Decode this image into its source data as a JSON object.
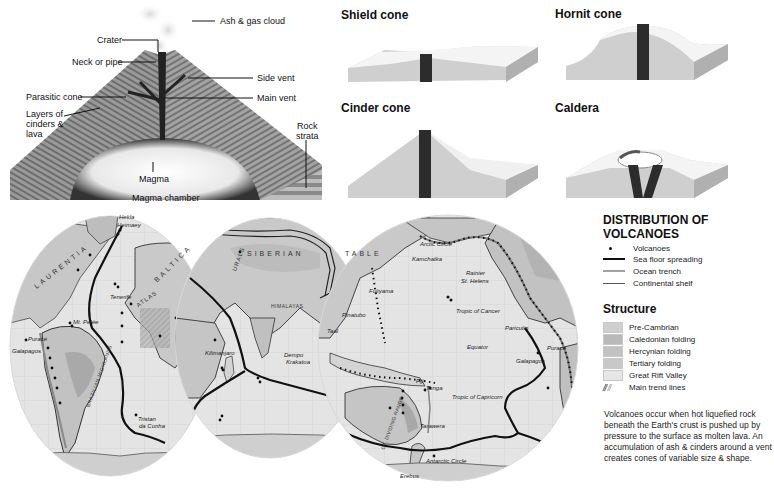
{
  "volcano_diagram": {
    "labels": {
      "ash_cloud": "Ash & gas cloud",
      "crater": "Crater",
      "neck": "Neck or pipe",
      "side_vent": "Side vent",
      "parasitic_cone": "Parasitic cone",
      "main_vent": "Main vent",
      "layers": [
        "Layers of",
        "cinders &",
        "lava"
      ],
      "rock_strata": [
        "Rock",
        "strata"
      ],
      "magma": "Magma",
      "magma_chamber": "Magma chamber"
    }
  },
  "cone_types": [
    {
      "title": "Shield cone"
    },
    {
      "title": "Hornit cone"
    },
    {
      "title": "Cinder cone"
    },
    {
      "title": "Caldera"
    }
  ],
  "map": {
    "regions": [
      "LAURENTIA",
      "BALTICA",
      "ATLAS",
      "SIBERIAN",
      "TABLE",
      "URALS",
      "BRAZILIAN HIGHLANDS",
      "HIMALAYAS",
      "GT. DIVIDING RANGE"
    ],
    "places": {
      "hekla": "Hekla",
      "heimaey": "Heimaey",
      "tenerife": "Tenerife",
      "mt_pelee": "Mt. Pelée",
      "purace_w": "Puracé",
      "galapagos_w": "Galapagos",
      "tristan": [
        "Tristan",
        "da Cunha"
      ],
      "kilimanjaro": "Kilimanjaro",
      "dempo": "Dempo",
      "krakatoa": "Krakatoa",
      "pinatubo": "Pinatubo",
      "taal": "Taal",
      "fujiyama": "Fujiyama",
      "kamchatka": "Kamchatka",
      "arctic_circle": "Arctic Circle",
      "rainier": "Rainier",
      "st_helens": "St. Helens",
      "tropic_cancer": "Tropic of Cancer",
      "paricutin": "Paricutin",
      "purace_e": "Puracé",
      "equator": "Equator",
      "galapagos_e": "Galapagos",
      "fuji_island": "Fiji",
      "tonga": "Tonga",
      "tropic_capricorn": "Tropic of Capricorn",
      "tarawera": "Tarawera",
      "antarctic_circle": "Antarctic Circle",
      "erebus": "Erebus"
    }
  },
  "legend": {
    "title": "DISTRIBUTION OF VOLCANOES",
    "items": [
      {
        "label": "Volcanoes",
        "symbol": "dot"
      },
      {
        "label": "Sea floor spreading",
        "symbol": "thick-line"
      },
      {
        "label": "Ocean trench",
        "symbol": "grey-line"
      },
      {
        "label": "Continental shelf",
        "symbol": "thin-line"
      }
    ],
    "structure_title": "Structure",
    "structure": [
      {
        "label": "Pre-Cambrian",
        "color": "#cfcfcf"
      },
      {
        "label": "Caledonian folding",
        "color": "#b9b9b9"
      },
      {
        "label": "Hercynian folding",
        "color": "#c2c2c2"
      },
      {
        "label": "Tertiary folding",
        "color": "#c8c8c8"
      },
      {
        "label": "Great Rift Valley",
        "color": "#e6e6e6"
      }
    ],
    "trend_lines_label": "Main trend lines"
  },
  "description": "Volcanoes occur when hot liquefied rock beneath the Earth's crust is pushed up by pressure to the surface as molten lava.  An accumulation of ash & cinders around a vent creates cones of variable size & shape."
}
